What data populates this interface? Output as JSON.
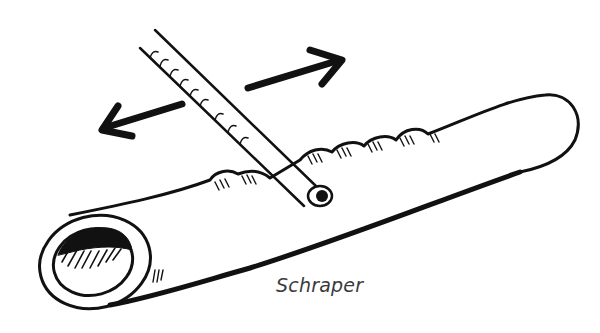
{
  "figure": {
    "caption": "Schraper",
    "elements": [
      {
        "name": "clay-coil",
        "shape": "hollow cylinder, open end front-left"
      },
      {
        "name": "scraper-stick",
        "shape": "long thin rod crossing diagonally over the coil"
      },
      {
        "name": "motion-arrow-right",
        "direction": "up-right"
      },
      {
        "name": "motion-arrow-left",
        "direction": "down-left"
      }
    ],
    "colors": {
      "ink": "#111111",
      "background": "#ffffff",
      "caption": "#3a3a3a"
    }
  }
}
